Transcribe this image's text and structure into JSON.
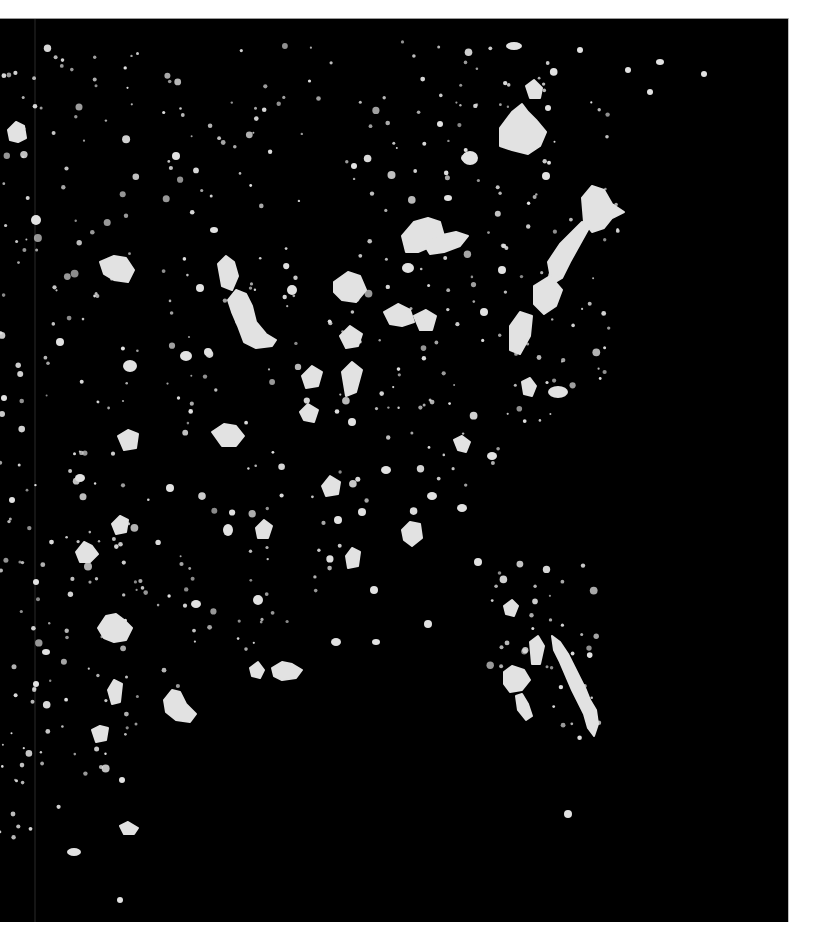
{
  "map": {
    "kind": "satellite night lights",
    "region": "Eastern United States",
    "background_color": "#000000",
    "light_color": "#e2e2e2",
    "page_color": "#ffffff",
    "frame": {
      "x": 0,
      "y": 18,
      "width": 788,
      "height": 904
    },
    "seam_line_x": 35,
    "clusters": [
      {
        "name": "boston",
        "shape": "poly",
        "points": "500,128 512,112 522,104 528,112 536,120 546,132 540,146 528,154 512,150 500,146"
      },
      {
        "name": "boston-north",
        "shape": "poly",
        "points": "526,86 534,80 542,88 540,98 530,98"
      },
      {
        "name": "providence",
        "shape": "ellipse",
        "cx": 514,
        "cy": 46,
        "rx": 8,
        "ry": 4
      },
      {
        "name": "albany",
        "shape": "ellipse",
        "cx": 470,
        "cy": 158,
        "rx": 8,
        "ry": 7
      },
      {
        "name": "new-york",
        "shape": "poly",
        "points": "582,198 592,186 604,190 612,204 624,212 612,218 604,228 592,232 584,222"
      },
      {
        "name": "nyc-longisland",
        "shape": "poly",
        "points": "548,262 560,244 572,232 582,222 590,226 580,244 570,262 562,278 552,284"
      },
      {
        "name": "philadelphia",
        "shape": "poly",
        "points": "534,286 550,276 562,290 556,306 544,314 534,304"
      },
      {
        "name": "baltimore-dc",
        "shape": "poly",
        "points": "510,326 520,312 532,316 530,336 520,354 510,350"
      },
      {
        "name": "buffalo-toronto-arc",
        "shape": "poly",
        "points": "402,236 414,222 428,218 440,222 444,236 432,246 418,252 406,252"
      },
      {
        "name": "rochester-syracuse",
        "shape": "poly",
        "points": "424,244 438,236 456,232 468,236 460,246 444,252 430,254"
      },
      {
        "name": "cleveland",
        "shape": "poly",
        "points": "384,312 398,304 410,310 414,322 402,326 390,324"
      },
      {
        "name": "pittsburgh",
        "shape": "poly",
        "points": "414,316 426,310 436,316 432,330 420,330"
      },
      {
        "name": "detroit",
        "shape": "poly",
        "points": "334,282 348,272 360,276 366,290 356,302 342,300 334,292"
      },
      {
        "name": "chicago",
        "shape": "poly",
        "points": "228,300 236,290 246,294 252,306 256,322 266,334 276,340 272,346 256,348 244,342 238,326 232,312"
      },
      {
        "name": "milwaukee",
        "shape": "poly",
        "points": "218,264 226,256 234,262 238,276 232,290 222,286"
      },
      {
        "name": "indianapolis",
        "shape": "poly",
        "points": "302,376 312,366 322,372 318,386 306,388"
      },
      {
        "name": "columbus",
        "shape": "poly",
        "points": "340,336 350,326 362,334 358,346 346,348"
      },
      {
        "name": "cincinnati",
        "shape": "poly",
        "points": "342,372 352,362 362,370 356,392 346,396"
      },
      {
        "name": "st-louis",
        "shape": "poly",
        "points": "212,432 224,424 236,426 244,436 236,446 222,446"
      },
      {
        "name": "kansas-city",
        "shape": "poly",
        "points": "118,436 128,430 138,434 136,448 124,450"
      },
      {
        "name": "minneapolis",
        "shape": "poly",
        "points": "100,262 114,256 126,258 134,270 128,282 114,280 104,274"
      },
      {
        "name": "omaha",
        "shape": "ellipse",
        "cx": 130,
        "cy": 366,
        "rx": 7,
        "ry": 6
      },
      {
        "name": "nashville",
        "shape": "poly",
        "points": "322,486 330,476 340,482 338,494 326,496"
      },
      {
        "name": "louisville",
        "shape": "poly",
        "points": "300,412 308,404 318,410 314,422 304,420"
      },
      {
        "name": "atlanta",
        "shape": "poly",
        "points": "402,530 410,522 420,524 422,538 412,546 404,540"
      },
      {
        "name": "charlotte",
        "shape": "poly",
        "points": "454,440 462,436 470,442 466,452 458,450"
      },
      {
        "name": "norfolk",
        "shape": "ellipse",
        "cx": 558,
        "cy": 392,
        "rx": 10,
        "ry": 6
      },
      {
        "name": "richmond",
        "shape": "poly",
        "points": "522,382 530,378 536,386 532,396 524,394"
      },
      {
        "name": "memphis",
        "shape": "poly",
        "points": "256,528 264,520 272,526 268,538 258,538"
      },
      {
        "name": "birmingham",
        "shape": "poly",
        "points": "346,556 352,548 360,552 358,566 348,568"
      },
      {
        "name": "oklahoma-city",
        "shape": "poly",
        "points": "76,552 84,542 92,546 98,554 90,562 80,562"
      },
      {
        "name": "tulsa",
        "shape": "poly",
        "points": "112,524 120,516 128,520 126,532 116,534"
      },
      {
        "name": "dallas",
        "shape": "poly",
        "points": "98,628 106,616 116,614 124,620 132,628 126,640 114,642 104,638"
      },
      {
        "name": "houston",
        "shape": "poly",
        "points": "164,700 172,690 180,692 186,704 196,714 190,722 176,720 166,712"
      },
      {
        "name": "austin",
        "shape": "poly",
        "points": "108,690 114,680 122,684 120,702 112,704"
      },
      {
        "name": "san-antonio",
        "shape": "poly",
        "points": "92,730 100,726 108,728 106,740 96,742"
      },
      {
        "name": "new-orleans",
        "shape": "poly",
        "points": "272,668 282,662 292,664 302,670 296,678 282,680 274,676"
      },
      {
        "name": "baton-rouge",
        "shape": "poly",
        "points": "250,668 258,662 264,670 260,678 252,676"
      },
      {
        "name": "jacksonville",
        "shape": "poly",
        "points": "504,606 512,600 518,606 514,616 506,614"
      },
      {
        "name": "orlando",
        "shape": "poly",
        "points": "530,642 538,636 544,646 540,664 532,664"
      },
      {
        "name": "tampa",
        "shape": "poly",
        "points": "504,672 512,666 524,670 530,680 522,690 510,692 504,684"
      },
      {
        "name": "florida-east-coast",
        "shape": "poly",
        "points": "552,636 560,642 568,654 574,666 580,678 586,690 590,700 596,710 598,724 594,736 588,728 584,714 578,702 572,690 566,676 560,662 554,650"
      },
      {
        "name": "florida-west-coast",
        "shape": "poly",
        "points": "516,696 522,694 528,704 532,716 526,720 518,710"
      },
      {
        "name": "corpus-christi",
        "shape": "poly",
        "points": "120,826 128,822 138,828 134,834 124,834"
      },
      {
        "name": "brownsville",
        "shape": "ellipse",
        "cx": 74,
        "cy": 852,
        "rx": 7,
        "ry": 4
      },
      {
        "name": "winnipeg-area",
        "shape": "poly",
        "points": "8,130 16,122 24,126 26,138 18,142 10,140"
      },
      {
        "name": "des-moines",
        "shape": "ellipse",
        "cx": 186,
        "cy": 356,
        "rx": 6,
        "ry": 5
      },
      {
        "name": "wichita",
        "shape": "ellipse",
        "cx": 80,
        "cy": 478,
        "rx": 5,
        "ry": 4
      },
      {
        "name": "little-rock",
        "shape": "ellipse",
        "cx": 228,
        "cy": 530,
        "rx": 5,
        "ry": 6
      },
      {
        "name": "jackson",
        "shape": "ellipse",
        "cx": 258,
        "cy": 600,
        "rx": 5,
        "ry": 5
      },
      {
        "name": "raleigh",
        "shape": "ellipse",
        "cx": 492,
        "cy": 456,
        "rx": 5,
        "ry": 4
      },
      {
        "name": "greenville",
        "shape": "ellipse",
        "cx": 432,
        "cy": 496,
        "rx": 5,
        "ry": 4
      },
      {
        "name": "columbia",
        "shape": "ellipse",
        "cx": 462,
        "cy": 508,
        "rx": 5,
        "ry": 4
      },
      {
        "name": "savannah",
        "shape": "ellipse",
        "cx": 478,
        "cy": 562,
        "rx": 4,
        "ry": 4
      },
      {
        "name": "shreveport",
        "shape": "ellipse",
        "cx": 196,
        "cy": 604,
        "rx": 5,
        "ry": 4
      },
      {
        "name": "mobile",
        "shape": "ellipse",
        "cx": 336,
        "cy": 642,
        "rx": 5,
        "ry": 4
      },
      {
        "name": "grand-rapids",
        "shape": "ellipse",
        "cx": 292,
        "cy": 290,
        "rx": 5,
        "ry": 5
      },
      {
        "name": "toronto",
        "shape": "ellipse",
        "cx": 408,
        "cy": 268,
        "rx": 6,
        "ry": 5
      },
      {
        "name": "montreal",
        "shape": "ellipse",
        "cx": 466,
        "cy": 158,
        "rx": 5,
        "ry": 4
      },
      {
        "name": "hartford",
        "shape": "ellipse",
        "cx": 546,
        "cy": 176,
        "rx": 4,
        "ry": 4
      },
      {
        "name": "scranton",
        "shape": "ellipse",
        "cx": 502,
        "cy": 270,
        "rx": 4,
        "ry": 4
      },
      {
        "name": "harrisburg",
        "shape": "ellipse",
        "cx": 484,
        "cy": 312,
        "rx": 4,
        "ry": 4
      },
      {
        "name": "lexington",
        "shape": "ellipse",
        "cx": 352,
        "cy": 422,
        "rx": 4,
        "ry": 4
      },
      {
        "name": "knoxville",
        "shape": "ellipse",
        "cx": 386,
        "cy": 470,
        "rx": 5,
        "ry": 4
      },
      {
        "name": "chattanooga",
        "shape": "ellipse",
        "cx": 362,
        "cy": 512,
        "rx": 4,
        "ry": 4
      },
      {
        "name": "huntsville",
        "shape": "ellipse",
        "cx": 338,
        "cy": 520,
        "rx": 4,
        "ry": 4
      },
      {
        "name": "montgomery",
        "shape": "ellipse",
        "cx": 374,
        "cy": 590,
        "rx": 4,
        "ry": 4
      },
      {
        "name": "tallahassee",
        "shape": "ellipse",
        "cx": 428,
        "cy": 624,
        "rx": 4,
        "ry": 4
      },
      {
        "name": "pensacola",
        "shape": "ellipse",
        "cx": 376,
        "cy": 642,
        "rx": 4,
        "ry": 3
      },
      {
        "name": "lubbock",
        "shape": "ellipse",
        "cx": 36,
        "cy": 582,
        "rx": 3,
        "ry": 3
      },
      {
        "name": "fargo",
        "shape": "ellipse",
        "cx": 36,
        "cy": 220,
        "rx": 5,
        "ry": 5
      },
      {
        "name": "sioux-falls",
        "shape": "ellipse",
        "cx": 60,
        "cy": 342,
        "rx": 4,
        "ry": 4
      },
      {
        "name": "duluth",
        "shape": "ellipse",
        "cx": 176,
        "cy": 156,
        "rx": 4,
        "ry": 4
      },
      {
        "name": "madison",
        "shape": "ellipse",
        "cx": 200,
        "cy": 288,
        "rx": 4,
        "ry": 4
      },
      {
        "name": "green-bay",
        "shape": "ellipse",
        "cx": 214,
        "cy": 230,
        "rx": 4,
        "ry": 3
      },
      {
        "name": "peoria",
        "shape": "ellipse",
        "cx": 208,
        "cy": 352,
        "rx": 4,
        "ry": 4
      },
      {
        "name": "springfield-mo",
        "shape": "ellipse",
        "cx": 170,
        "cy": 488,
        "rx": 4,
        "ry": 4
      },
      {
        "name": "bermuda-dot",
        "shape": "ellipse",
        "cx": 568,
        "cy": 814,
        "rx": 4,
        "ry": 4
      },
      {
        "name": "ottawa",
        "shape": "ellipse",
        "cx": 448,
        "cy": 198,
        "rx": 4,
        "ry": 3
      },
      {
        "name": "sudbury",
        "shape": "ellipse",
        "cx": 354,
        "cy": 166,
        "rx": 3,
        "ry": 3
      },
      {
        "name": "saint-john",
        "shape": "ellipse",
        "cx": 650,
        "cy": 92,
        "rx": 3,
        "ry": 3
      },
      {
        "name": "halifax",
        "shape": "ellipse",
        "cx": 704,
        "cy": 74,
        "rx": 3,
        "ry": 3
      },
      {
        "name": "moncton",
        "shape": "ellipse",
        "cx": 660,
        "cy": 62,
        "rx": 4,
        "ry": 3
      },
      {
        "name": "quebec",
        "shape": "ellipse",
        "cx": 628,
        "cy": 70,
        "rx": 3,
        "ry": 3
      },
      {
        "name": "portland-me",
        "shape": "ellipse",
        "cx": 580,
        "cy": 50,
        "rx": 3,
        "ry": 3
      },
      {
        "name": "bangor",
        "shape": "ellipse",
        "cx": 548,
        "cy": 108,
        "rx": 3,
        "ry": 3
      },
      {
        "name": "burlington",
        "shape": "ellipse",
        "cx": 440,
        "cy": 124,
        "rx": 3,
        "ry": 3
      },
      {
        "name": "el-paso-edge",
        "shape": "ellipse",
        "cx": 4,
        "cy": 398,
        "rx": 3,
        "ry": 3
      },
      {
        "name": "amarillo",
        "shape": "ellipse",
        "cx": 12,
        "cy": 500,
        "rx": 3,
        "ry": 3
      },
      {
        "name": "abilene",
        "shape": "ellipse",
        "cx": 46,
        "cy": 652,
        "rx": 4,
        "ry": 3
      },
      {
        "name": "laredo",
        "shape": "ellipse",
        "cx": 36,
        "cy": 684,
        "rx": 3,
        "ry": 3
      },
      {
        "name": "victoria-tx",
        "shape": "ellipse",
        "cx": 122,
        "cy": 780,
        "rx": 3,
        "ry": 3
      },
      {
        "name": "mcallen",
        "shape": "ellipse",
        "cx": 120,
        "cy": 900,
        "rx": 3,
        "ry": 3
      }
    ],
    "dust_seed": 7,
    "dust_count": 520
  }
}
